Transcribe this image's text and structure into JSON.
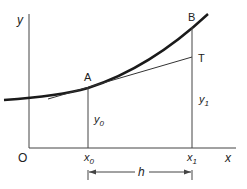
{
  "diagram": {
    "axes": {
      "y_label": "y",
      "x_label": "x",
      "origin_label": "O"
    },
    "points": {
      "A": "A",
      "B": "B",
      "T": "T"
    },
    "ordinates": {
      "y0": "y",
      "y0_sub": "0",
      "y1": "y",
      "y1_sub": "1"
    },
    "abscissae": {
      "x0": "x",
      "x0_sub": "0",
      "x1": "x",
      "x1_sub": "1"
    },
    "interval": {
      "label": "h"
    },
    "colors": {
      "line": "#333333",
      "curve": "#1a1a1a",
      "background": "#ffffff"
    }
  }
}
